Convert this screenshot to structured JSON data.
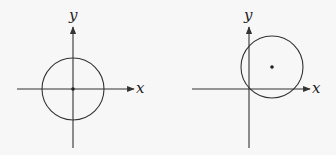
{
  "diagrams": [
    {
      "name": "circle-centered-at-origin",
      "x_label": "x",
      "y_label": "y",
      "axis_origin": [
        73,
        89
      ],
      "circle": {
        "cx": 73,
        "cy": 89,
        "r": 31
      },
      "center_point": [
        73,
        89
      ]
    },
    {
      "name": "circle-shifted-first-quadrant",
      "x_label": "x",
      "y_label": "y",
      "axis_origin": [
        249,
        89
      ],
      "circle": {
        "cx": 272,
        "cy": 67,
        "r": 31
      },
      "center_point": [
        272,
        67
      ]
    }
  ],
  "colors": {
    "stroke": "#333333",
    "background": "#f7f7f7"
  }
}
